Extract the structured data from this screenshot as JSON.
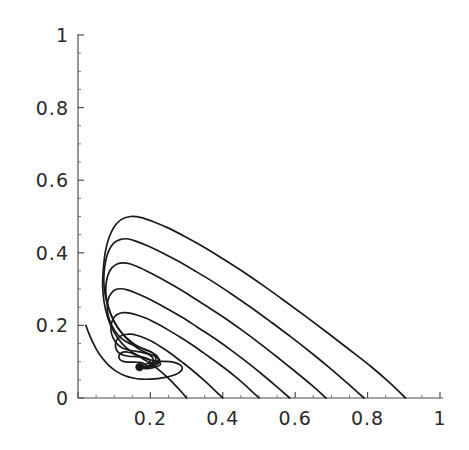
{
  "figure": {
    "kind": "phase-portrait",
    "background_color": "#ffffff",
    "curve_color": "#1a1a1a",
    "axis_color": "#4a4a4a",
    "label_color": "#2b2b2b"
  },
  "chart_data": {
    "type": "line",
    "title": "",
    "subtitle": "",
    "xlabel": "",
    "ylabel": "",
    "xlim": [
      0,
      1
    ],
    "ylim": [
      0,
      1
    ],
    "grid": false,
    "legend": null,
    "x_ticks": [
      0,
      0.2,
      0.4,
      0.6,
      0.8,
      1
    ],
    "x_tick_labels": [
      "0",
      "0.2",
      "0.4",
      "0.6",
      "0.8",
      "1"
    ],
    "y_ticks": [
      0,
      0.2,
      0.4,
      0.6,
      0.8,
      1
    ],
    "y_tick_labels": [
      "0",
      "0.2",
      "0.4",
      "0.6",
      "0.8",
      "1"
    ],
    "x_minor_tick_step": 0.05,
    "y_minor_tick_step": 0.05,
    "annotations": [
      {
        "name": "spiral-focus",
        "x": 0.17,
        "y": 0.085,
        "label": ""
      }
    ],
    "series": [
      {
        "name": "trajectory-1",
        "start": [
          0.905,
          0.0
        ],
        "peak": [
          0.157,
          0.5
        ],
        "end": [
          0.17,
          0.085
        ],
        "points": [
          [
            0.905,
            0.0
          ],
          [
            0.86,
            0.043
          ],
          [
            0.81,
            0.086
          ],
          [
            0.75,
            0.133
          ],
          [
            0.69,
            0.179
          ],
          [
            0.63,
            0.224
          ],
          [
            0.57,
            0.268
          ],
          [
            0.51,
            0.311
          ],
          [
            0.45,
            0.352
          ],
          [
            0.39,
            0.39
          ],
          [
            0.34,
            0.42
          ],
          [
            0.295,
            0.445
          ],
          [
            0.25,
            0.468
          ],
          [
            0.21,
            0.485
          ],
          [
            0.175,
            0.497
          ],
          [
            0.145,
            0.5
          ],
          [
            0.12,
            0.492
          ],
          [
            0.1,
            0.472
          ],
          [
            0.085,
            0.44
          ],
          [
            0.075,
            0.4
          ],
          [
            0.07,
            0.355
          ],
          [
            0.068,
            0.31
          ],
          [
            0.072,
            0.265
          ],
          [
            0.082,
            0.222
          ],
          [
            0.098,
            0.184
          ],
          [
            0.12,
            0.152
          ],
          [
            0.148,
            0.127
          ],
          [
            0.178,
            0.112
          ],
          [
            0.205,
            0.104
          ],
          [
            0.222,
            0.1
          ],
          [
            0.228,
            0.094
          ],
          [
            0.222,
            0.088
          ],
          [
            0.205,
            0.083
          ],
          [
            0.19,
            0.081
          ],
          [
            0.178,
            0.082
          ],
          [
            0.171,
            0.085
          ]
        ]
      },
      {
        "name": "trajectory-2",
        "start": [
          0.79,
          0.0
        ],
        "peak": [
          0.152,
          0.44
        ],
        "end": [
          0.17,
          0.085
        ],
        "points": [
          [
            0.79,
            0.0
          ],
          [
            0.745,
            0.04
          ],
          [
            0.7,
            0.079
          ],
          [
            0.645,
            0.124
          ],
          [
            0.59,
            0.167
          ],
          [
            0.535,
            0.208
          ],
          [
            0.48,
            0.248
          ],
          [
            0.425,
            0.286
          ],
          [
            0.37,
            0.322
          ],
          [
            0.32,
            0.352
          ],
          [
            0.275,
            0.378
          ],
          [
            0.235,
            0.399
          ],
          [
            0.195,
            0.418
          ],
          [
            0.165,
            0.43
          ],
          [
            0.14,
            0.438
          ],
          [
            0.118,
            0.437
          ],
          [
            0.1,
            0.428
          ],
          [
            0.086,
            0.408
          ],
          [
            0.077,
            0.38
          ],
          [
            0.072,
            0.345
          ],
          [
            0.072,
            0.308
          ],
          [
            0.078,
            0.27
          ],
          [
            0.09,
            0.232
          ],
          [
            0.108,
            0.197
          ],
          [
            0.132,
            0.166
          ],
          [
            0.158,
            0.142
          ],
          [
            0.186,
            0.126
          ],
          [
            0.208,
            0.117
          ],
          [
            0.222,
            0.11
          ],
          [
            0.226,
            0.101
          ],
          [
            0.219,
            0.093
          ],
          [
            0.203,
            0.087
          ],
          [
            0.188,
            0.083
          ],
          [
            0.176,
            0.083
          ],
          [
            0.171,
            0.085
          ]
        ]
      },
      {
        "name": "trajectory-3",
        "start": [
          0.685,
          0.0
        ],
        "peak": [
          0.148,
          0.373
        ],
        "end": [
          0.17,
          0.085
        ],
        "points": [
          [
            0.685,
            0.0
          ],
          [
            0.645,
            0.036
          ],
          [
            0.6,
            0.073
          ],
          [
            0.55,
            0.113
          ],
          [
            0.5,
            0.152
          ],
          [
            0.45,
            0.189
          ],
          [
            0.4,
            0.224
          ],
          [
            0.35,
            0.256
          ],
          [
            0.305,
            0.285
          ],
          [
            0.265,
            0.309
          ],
          [
            0.228,
            0.33
          ],
          [
            0.195,
            0.347
          ],
          [
            0.168,
            0.36
          ],
          [
            0.145,
            0.369
          ],
          [
            0.125,
            0.372
          ],
          [
            0.108,
            0.369
          ],
          [
            0.094,
            0.359
          ],
          [
            0.084,
            0.342
          ],
          [
            0.078,
            0.318
          ],
          [
            0.077,
            0.29
          ],
          [
            0.082,
            0.258
          ],
          [
            0.093,
            0.225
          ],
          [
            0.11,
            0.193
          ],
          [
            0.133,
            0.167
          ],
          [
            0.158,
            0.147
          ],
          [
            0.184,
            0.134
          ],
          [
            0.205,
            0.125
          ],
          [
            0.218,
            0.116
          ],
          [
            0.222,
            0.105
          ],
          [
            0.216,
            0.095
          ],
          [
            0.201,
            0.088
          ],
          [
            0.186,
            0.084
          ],
          [
            0.175,
            0.084
          ],
          [
            0.171,
            0.085
          ]
        ]
      },
      {
        "name": "trajectory-4",
        "start": [
          0.585,
          0.0
        ],
        "peak": [
          0.145,
          0.302
        ],
        "end": [
          0.17,
          0.085
        ],
        "points": [
          [
            0.585,
            0.0
          ],
          [
            0.548,
            0.032
          ],
          [
            0.51,
            0.064
          ],
          [
            0.465,
            0.1
          ],
          [
            0.42,
            0.134
          ],
          [
            0.375,
            0.166
          ],
          [
            0.33,
            0.195
          ],
          [
            0.29,
            0.221
          ],
          [
            0.25,
            0.244
          ],
          [
            0.215,
            0.263
          ],
          [
            0.185,
            0.278
          ],
          [
            0.158,
            0.29
          ],
          [
            0.136,
            0.298
          ],
          [
            0.118,
            0.301
          ],
          [
            0.104,
            0.299
          ],
          [
            0.093,
            0.29
          ],
          [
            0.085,
            0.276
          ],
          [
            0.081,
            0.257
          ],
          [
            0.082,
            0.234
          ],
          [
            0.089,
            0.21
          ],
          [
            0.102,
            0.185
          ],
          [
            0.12,
            0.164
          ],
          [
            0.142,
            0.15
          ],
          [
            0.166,
            0.141
          ],
          [
            0.188,
            0.133
          ],
          [
            0.205,
            0.125
          ],
          [
            0.214,
            0.113
          ],
          [
            0.214,
            0.102
          ],
          [
            0.204,
            0.092
          ],
          [
            0.189,
            0.086
          ],
          [
            0.177,
            0.084
          ],
          [
            0.171,
            0.085
          ]
        ]
      },
      {
        "name": "trajectory-5",
        "start": [
          0.5,
          0.0
        ],
        "peak": [
          0.142,
          0.235
        ],
        "end": [
          0.17,
          0.085
        ],
        "points": [
          [
            0.5,
            0.0
          ],
          [
            0.47,
            0.028
          ],
          [
            0.438,
            0.056
          ],
          [
            0.4,
            0.086
          ],
          [
            0.36,
            0.115
          ],
          [
            0.322,
            0.142
          ],
          [
            0.285,
            0.166
          ],
          [
            0.25,
            0.187
          ],
          [
            0.218,
            0.205
          ],
          [
            0.19,
            0.219
          ],
          [
            0.165,
            0.228
          ],
          [
            0.143,
            0.234
          ],
          [
            0.126,
            0.235
          ],
          [
            0.112,
            0.232
          ],
          [
            0.101,
            0.224
          ],
          [
            0.094,
            0.211
          ],
          [
            0.091,
            0.195
          ],
          [
            0.093,
            0.176
          ],
          [
            0.101,
            0.158
          ],
          [
            0.116,
            0.142
          ],
          [
            0.136,
            0.133
          ],
          [
            0.158,
            0.129
          ],
          [
            0.18,
            0.125
          ],
          [
            0.197,
            0.119
          ],
          [
            0.207,
            0.109
          ],
          [
            0.207,
            0.099
          ],
          [
            0.198,
            0.091
          ],
          [
            0.185,
            0.086
          ],
          [
            0.175,
            0.085
          ],
          [
            0.171,
            0.085
          ]
        ]
      },
      {
        "name": "trajectory-6",
        "start": [
          0.4,
          0.0
        ],
        "peak": [
          0.142,
          0.175
        ],
        "end": [
          0.17,
          0.085
        ],
        "points": [
          [
            0.4,
            0.0
          ],
          [
            0.375,
            0.024
          ],
          [
            0.35,
            0.047
          ],
          [
            0.32,
            0.073
          ],
          [
            0.29,
            0.097
          ],
          [
            0.26,
            0.12
          ],
          [
            0.232,
            0.139
          ],
          [
            0.206,
            0.155
          ],
          [
            0.182,
            0.166
          ],
          [
            0.162,
            0.173
          ],
          [
            0.145,
            0.176
          ],
          [
            0.13,
            0.175
          ],
          [
            0.118,
            0.171
          ],
          [
            0.109,
            0.163
          ],
          [
            0.104,
            0.152
          ],
          [
            0.104,
            0.139
          ],
          [
            0.11,
            0.127
          ],
          [
            0.122,
            0.119
          ],
          [
            0.14,
            0.115
          ],
          [
            0.16,
            0.114
          ],
          [
            0.18,
            0.112
          ],
          [
            0.194,
            0.107
          ],
          [
            0.2,
            0.099
          ],
          [
            0.198,
            0.091
          ],
          [
            0.188,
            0.086
          ],
          [
            0.177,
            0.085
          ],
          [
            0.171,
            0.085
          ]
        ]
      },
      {
        "name": "trajectory-7",
        "start": [
          0.3,
          0.0
        ],
        "peak": [
          0.148,
          0.128
        ],
        "end": [
          0.17,
          0.085
        ],
        "points": [
          [
            0.3,
            0.0
          ],
          [
            0.283,
            0.02
          ],
          [
            0.265,
            0.039
          ],
          [
            0.245,
            0.059
          ],
          [
            0.224,
            0.077
          ],
          [
            0.203,
            0.093
          ],
          [
            0.184,
            0.105
          ],
          [
            0.167,
            0.115
          ],
          [
            0.152,
            0.122
          ],
          [
            0.14,
            0.126
          ],
          [
            0.13,
            0.127
          ],
          [
            0.121,
            0.125
          ],
          [
            0.115,
            0.12
          ],
          [
            0.113,
            0.113
          ],
          [
            0.116,
            0.106
          ],
          [
            0.125,
            0.101
          ],
          [
            0.139,
            0.099
          ],
          [
            0.155,
            0.099
          ],
          [
            0.17,
            0.098
          ],
          [
            0.182,
            0.095
          ],
          [
            0.188,
            0.09
          ],
          [
            0.185,
            0.086
          ],
          [
            0.176,
            0.085
          ],
          [
            0.171,
            0.085
          ]
        ]
      },
      {
        "name": "trajectory-8",
        "start": [
          0.022,
          0.2
        ],
        "peak": [
          0.022,
          0.2
        ],
        "end": [
          0.17,
          0.085
        ],
        "points": [
          [
            0.022,
            0.2
          ],
          [
            0.03,
            0.178
          ],
          [
            0.04,
            0.155
          ],
          [
            0.052,
            0.132
          ],
          [
            0.067,
            0.11
          ],
          [
            0.085,
            0.09
          ],
          [
            0.105,
            0.074
          ],
          [
            0.128,
            0.062
          ],
          [
            0.152,
            0.055
          ],
          [
            0.175,
            0.052
          ],
          [
            0.2,
            0.052
          ],
          [
            0.225,
            0.054
          ],
          [
            0.248,
            0.058
          ],
          [
            0.268,
            0.064
          ],
          [
            0.282,
            0.072
          ],
          [
            0.288,
            0.081
          ],
          [
            0.284,
            0.09
          ],
          [
            0.272,
            0.096
          ],
          [
            0.254,
            0.1
          ],
          [
            0.232,
            0.101
          ],
          [
            0.21,
            0.099
          ],
          [
            0.192,
            0.095
          ],
          [
            0.18,
            0.09
          ],
          [
            0.173,
            0.086
          ],
          [
            0.171,
            0.085
          ]
        ]
      }
    ]
  },
  "axes": {
    "x_axis_name": "x-axis",
    "y_axis_name": "y-axis",
    "x_labels": [
      "0.2",
      "0.4",
      "0.6",
      "0.8",
      "1"
    ],
    "y_labels": [
      "1",
      "0.8",
      "0.6",
      "0.4",
      "0.2",
      "0"
    ],
    "x_label_0": "0",
    "origin_label": "0"
  }
}
